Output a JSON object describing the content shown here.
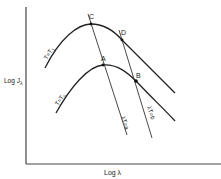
{
  "diagram": {
    "axes": {
      "y_label_main": "Log J",
      "y_label_sub": "λ",
      "x_label": "Log λ"
    },
    "curves": [
      {
        "id": "upper",
        "label": "T=T",
        "label_sub": "1"
      },
      {
        "id": "lower",
        "label": "T=T",
        "label_sub": "0"
      }
    ],
    "lines": [
      {
        "id": "a",
        "label": "λT=a"
      },
      {
        "id": "b",
        "label": "λT=b"
      }
    ],
    "points": [
      {
        "id": "C",
        "label": "C"
      },
      {
        "id": "D",
        "label": "D"
      },
      {
        "id": "A",
        "label": "A"
      },
      {
        "id": "B",
        "label": "B"
      }
    ],
    "colors": {
      "line": "#222222",
      "background": "#ffffff"
    }
  }
}
